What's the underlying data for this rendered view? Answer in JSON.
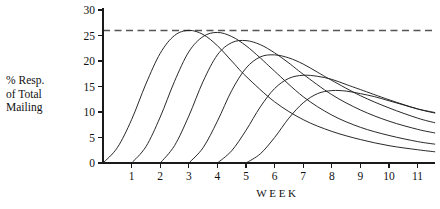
{
  "chart_data": {
    "type": "line",
    "title": "",
    "subtitle": "",
    "xlabel": "W E E K",
    "xlabel_plain": "WEEK",
    "ylabel": "% Resp. of Total Mailing",
    "ylabel_lines": [
      "% Resp.",
      "of Total",
      "Mailing"
    ],
    "xlim": [
      0,
      11.6
    ],
    "ylim": [
      0,
      30
    ],
    "x_ticks": [
      1,
      2,
      3,
      4,
      5,
      6,
      7,
      8,
      9,
      10,
      11
    ],
    "y_ticks": [
      0,
      5,
      10,
      15,
      20,
      25,
      30
    ],
    "grid": false,
    "legend": "none",
    "annotations": [
      {
        "name": "peak-reference-line",
        "type": "horizontal-dashed-line",
        "y": 26,
        "label": ""
      }
    ],
    "series": [
      {
        "name": "Mailing 1",
        "start_week": 0,
        "peak_week": 3.0,
        "peak_value": 26.0,
        "x": [
          0,
          0.5,
          1,
          1.5,
          2,
          2.5,
          3,
          3.5,
          4,
          4.5,
          5,
          6,
          7,
          8,
          9,
          10,
          11,
          11.6
        ],
        "values": [
          0,
          3.0,
          8.5,
          15.5,
          21.5,
          25.0,
          26.0,
          25.2,
          23.0,
          20.0,
          17.0,
          12.0,
          8.5,
          6.2,
          4.6,
          3.4,
          2.6,
          2.2
        ]
      },
      {
        "name": "Mailing 2",
        "start_week": 1,
        "peak_week": 3.9,
        "peak_value": 25.6,
        "x": [
          1,
          1.5,
          2,
          2.5,
          3,
          3.5,
          4,
          4.5,
          5,
          5.5,
          6,
          7,
          8,
          9,
          10,
          11,
          11.6
        ],
        "values": [
          0,
          3.2,
          9.0,
          16.0,
          21.8,
          24.8,
          25.6,
          24.8,
          23.0,
          20.6,
          18.0,
          13.0,
          9.4,
          7.0,
          5.4,
          4.2,
          3.7
        ]
      },
      {
        "name": "Mailing 3",
        "start_week": 2,
        "peak_week": 4.8,
        "peak_value": 24.0,
        "x": [
          2,
          2.5,
          3,
          3.5,
          4,
          4.5,
          5,
          5.5,
          6,
          6.5,
          7,
          8,
          9,
          10,
          11,
          11.6
        ],
        "values": [
          0,
          3.4,
          9.2,
          16.0,
          21.2,
          23.6,
          24.0,
          23.2,
          21.6,
          19.6,
          17.4,
          13.4,
          10.4,
          8.2,
          6.6,
          5.9
        ]
      },
      {
        "name": "Mailing 4",
        "start_week": 3,
        "peak_week": 5.8,
        "peak_value": 21.2,
        "x": [
          3,
          3.5,
          4,
          4.5,
          5,
          5.5,
          6,
          6.5,
          7,
          7.5,
          8,
          9,
          10,
          11,
          11.6
        ],
        "values": [
          0,
          3.0,
          8.2,
          14.2,
          18.6,
          20.8,
          21.2,
          20.6,
          19.4,
          17.8,
          16.2,
          13.2,
          10.8,
          8.8,
          7.9
        ]
      },
      {
        "name": "Mailing 5",
        "start_week": 4,
        "peak_week": 7.0,
        "peak_value": 17.2,
        "x": [
          4,
          4.5,
          5,
          5.5,
          6,
          6.5,
          7,
          7.5,
          8,
          8.5,
          9,
          10,
          11,
          11.6
        ],
        "values": [
          0,
          2.4,
          6.4,
          11.0,
          14.6,
          16.6,
          17.2,
          17.0,
          16.4,
          15.4,
          14.4,
          12.4,
          10.6,
          9.8
        ]
      },
      {
        "name": "Mailing 6",
        "start_week": 5,
        "peak_week": 8.2,
        "peak_value": 14.2,
        "x": [
          5,
          5.5,
          6,
          6.5,
          7,
          7.5,
          8,
          8.5,
          9,
          9.5,
          10,
          10.5,
          11,
          11.6
        ],
        "values": [
          0,
          1.8,
          5.0,
          8.8,
          11.8,
          13.6,
          14.2,
          14.1,
          13.6,
          13.0,
          12.2,
          11.4,
          10.6,
          9.9
        ]
      }
    ],
    "colors": {
      "curve": "#1d1d1d",
      "axis": "#1a1a1a",
      "reference_line": "#555555",
      "background": "#ffffff",
      "text": "#111111"
    }
  }
}
